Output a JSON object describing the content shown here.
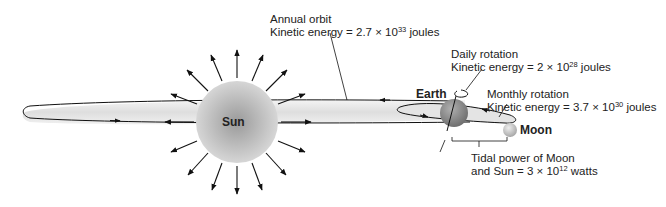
{
  "bodies": {
    "sun": {
      "label": "Sun"
    },
    "earth": {
      "label": "Earth"
    },
    "moon": {
      "label": "Moon"
    }
  },
  "annotations": {
    "annual_orbit": {
      "line1": "Annual orbit",
      "line2_prefix": "Kinetic energy = 2.7 × 10",
      "line2_exp": "33",
      "line2_suffix": " joules"
    },
    "daily_rotation": {
      "line1": "Daily rotation",
      "line2_prefix": "Kinetic energy = 2 × 10",
      "line2_exp": "28",
      "line2_suffix": " joules"
    },
    "monthly_rotation": {
      "line1": "Monthly rotation",
      "line2_prefix": "Kinetic energy = 3.7 × 10",
      "line2_exp": "30",
      "line2_suffix": " joules"
    },
    "tidal_power": {
      "line1": "Tidal power of Moon",
      "line2_prefix": "and Sun = 3 × 10",
      "line2_exp": "12",
      "line2_suffix": " watts"
    }
  },
  "colors": {
    "sun_center": "#9a9a9a",
    "sun_edge": "#d4d4d4",
    "orbit_fill": "#e8e8e8",
    "earth": "#8c8c8c",
    "moon": "#c8c8c8",
    "line": "#111111"
  }
}
